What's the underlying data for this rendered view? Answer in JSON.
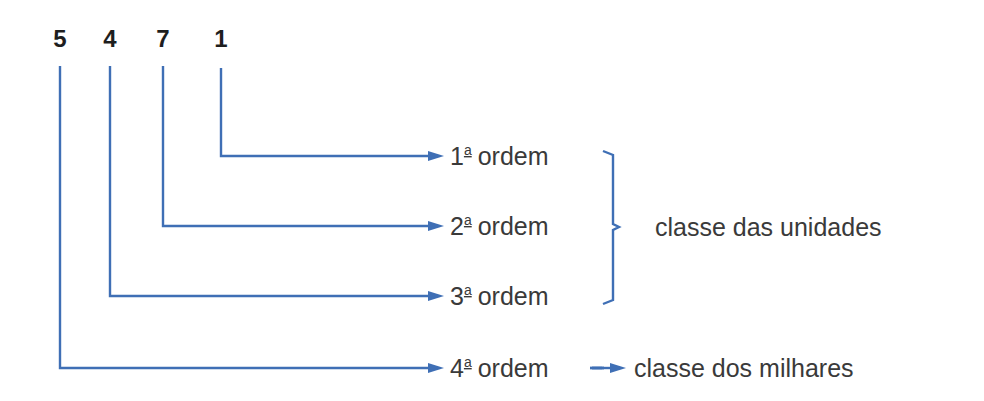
{
  "number": {
    "digits": [
      "5",
      "4",
      "7",
      "1"
    ]
  },
  "orders": [
    {
      "num": "1",
      "sup": "a",
      "word": "ordem"
    },
    {
      "num": "2",
      "sup": "a",
      "word": "ordem"
    },
    {
      "num": "3",
      "sup": "a",
      "word": "ordem"
    },
    {
      "num": "4",
      "sup": "a",
      "word": "ordem"
    }
  ],
  "classes": {
    "units": "classe das unidades",
    "thousands": "classe dos milhares"
  },
  "colors": {
    "line": "#3f6fb5",
    "text": "#3a3a3a",
    "digits": "#1e1e1e"
  }
}
